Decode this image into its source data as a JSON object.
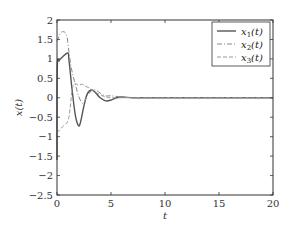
{
  "chart_data": {
    "type": "line",
    "title": "",
    "xlabel": "t",
    "ylabel": "x(t)",
    "xlim": [
      0,
      20
    ],
    "ylim": [
      -2.5,
      2
    ],
    "xticks": [
      0,
      5,
      10,
      15,
      20
    ],
    "yticks": [
      2,
      1.5,
      1,
      0.5,
      0,
      -0.5,
      -1,
      -1.5,
      -2,
      -2.5
    ],
    "xtick_labels": [
      "0",
      "5",
      "10",
      "15",
      "20"
    ],
    "ytick_labels": [
      "2",
      "1.5",
      "1",
      "0.5",
      "0",
      "−0.5",
      "−1",
      "−1.5",
      "−2",
      "−2.5"
    ],
    "grid": false,
    "legend_position": "upper right",
    "series": [
      {
        "name": "x1(t)",
        "label_main": "x",
        "label_sub": "1",
        "label_tail": "(t)",
        "style": "solid",
        "color": "#555555",
        "x": [
          0,
          0.02,
          0.2,
          0.5,
          1.0,
          1.1,
          1.4,
          1.7,
          2.0,
          2.2,
          2.5,
          2.8,
          3.2,
          3.6,
          4.0,
          4.5,
          5.0,
          5.5,
          6.0,
          7.0,
          8.0,
          10,
          15,
          20
        ],
        "y": [
          -1.6,
          0.75,
          0.95,
          1.05,
          1.15,
          1.0,
          0.2,
          -0.45,
          -0.72,
          -0.6,
          -0.2,
          0.1,
          0.2,
          0.12,
          0.0,
          -0.08,
          -0.06,
          0.0,
          0.02,
          0.0,
          0.0,
          0.0,
          0.0,
          0.0
        ]
      },
      {
        "name": "x2(t)",
        "label_main": "x",
        "label_sub": "2",
        "label_tail": "(t)",
        "style": "dashdot",
        "color": "#888888",
        "x": [
          0,
          0.3,
          0.6,
          0.9,
          1.1,
          1.3,
          1.6,
          2.0,
          2.4,
          2.8,
          3.2,
          3.6,
          4.0,
          4.5,
          5.0,
          6.0,
          7.0,
          8.0,
          10,
          15,
          20
        ],
        "y": [
          1.45,
          1.65,
          1.7,
          1.6,
          1.2,
          0.8,
          0.45,
          0.05,
          -0.15,
          0.05,
          0.18,
          0.2,
          0.12,
          0.05,
          0.05,
          0.02,
          0.0,
          0.0,
          0.0,
          0.0,
          0.0
        ]
      },
      {
        "name": "x3(t)",
        "label_main": "x",
        "label_sub": "3",
        "label_tail": "(t)",
        "style": "dashed",
        "color": "#999999",
        "x": [
          0,
          0.5,
          1.0,
          1.2,
          1.4,
          1.6,
          1.8,
          2.0,
          2.3,
          2.6,
          3.0,
          3.5,
          4.0,
          4.5,
          5.0,
          6.0,
          7.0,
          8.0,
          10,
          15,
          20
        ],
        "y": [
          -0.9,
          -0.75,
          -0.6,
          -0.3,
          0.2,
          0.35,
          0.35,
          0.32,
          0.35,
          0.3,
          0.25,
          0.15,
          0.08,
          0.02,
          0.0,
          0.0,
          0.0,
          0.0,
          0.0,
          0.0,
          0.0
        ]
      }
    ]
  },
  "layout": {
    "plot_left": 57,
    "plot_top": 20,
    "plot_right": 273,
    "plot_bottom": 195
  }
}
